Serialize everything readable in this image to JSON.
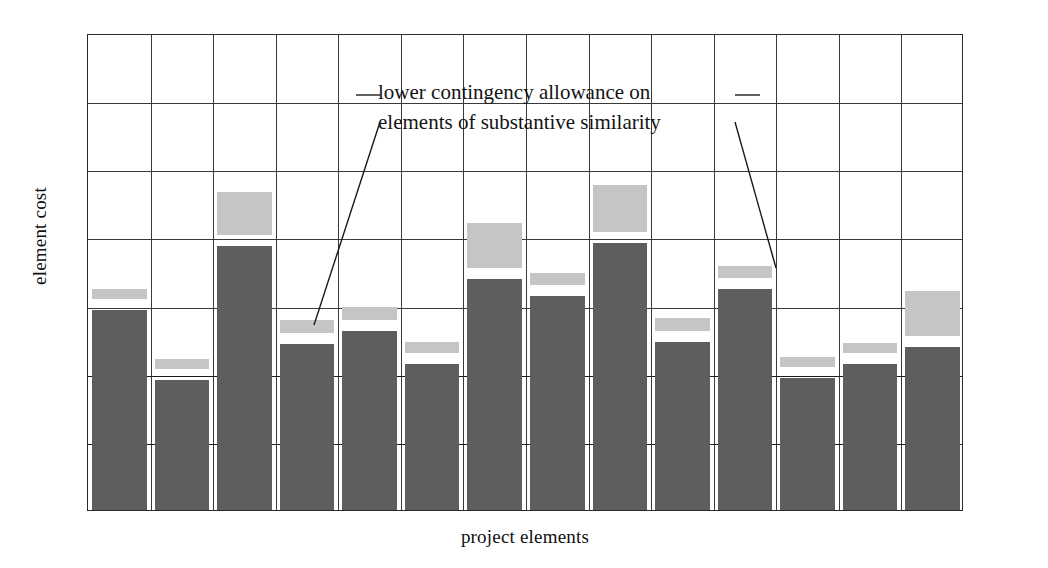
{
  "chart_data": {
    "type": "bar",
    "title": "",
    "subtitle": "",
    "xlabel": "project elements",
    "ylabel": "element cost",
    "grid": true,
    "legend_position": "none",
    "ylim": [
      0,
      7
    ],
    "xlim": [
      0,
      14
    ],
    "gridlines_y": 7,
    "gridlines_x": 14,
    "axis_tick_labels_x": [],
    "axis_tick_labels_y": [],
    "categories": [
      "1",
      "2",
      "3",
      "4",
      "5",
      "6",
      "7",
      "8",
      "9",
      "10",
      "11",
      "12",
      "13",
      "14"
    ],
    "series": [
      {
        "name": "base element cost",
        "color": "#5e5e5e",
        "values": [
          2.93,
          1.91,
          3.88,
          2.44,
          2.63,
          2.14,
          3.39,
          3.14,
          3.92,
          2.47,
          3.24,
          1.93,
          2.14,
          2.39
        ]
      },
      {
        "name": "contingency allowance",
        "color": "#c5c5c5",
        "values": [
          0.15,
          0.15,
          0.63,
          0.19,
          0.19,
          0.16,
          0.66,
          0.18,
          0.69,
          0.19,
          0.18,
          0.15,
          0.15,
          0.66
        ]
      }
    ],
    "annotations": [
      {
        "text_line_1": "lower contingency allowance on",
        "text_line_2": "elements of substantive similarity",
        "points_to": [
          "bar-4",
          "bar-11"
        ]
      }
    ]
  },
  "axes": {
    "y_title": "element cost",
    "x_title": "project elements"
  },
  "annotation": {
    "line1": "lower contingency allowance on",
    "line2": "elements of substantive similarity"
  },
  "colors": {
    "base_bar": "#5e5e5e",
    "contingency_bar": "#c5c5c5",
    "grid": "#3a3a3a",
    "grid_major": "#1c1c1c",
    "frame": "#2b2b2b",
    "text": "#141414",
    "background": "#ffffff"
  }
}
